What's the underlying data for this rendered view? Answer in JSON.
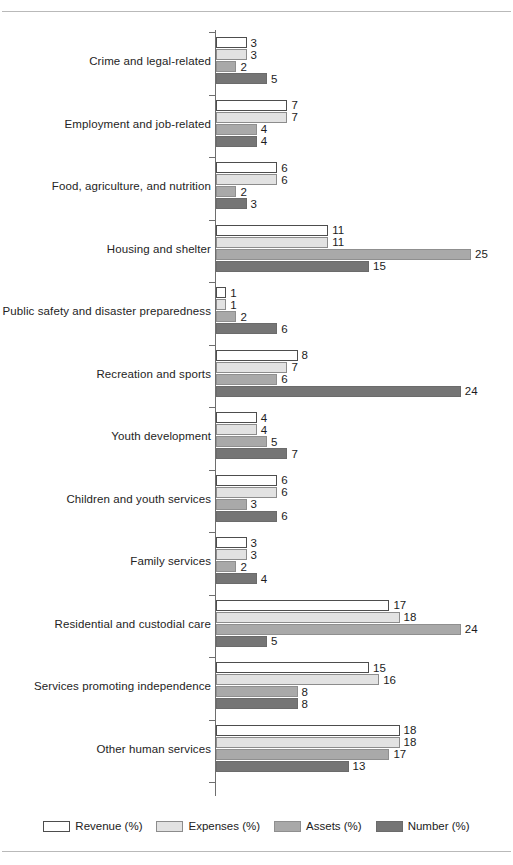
{
  "chart_data": {
    "type": "bar",
    "orientation": "horizontal",
    "title": "",
    "subtitle": "",
    "xlabel": "",
    "ylabel": "",
    "xlim": [
      0,
      25
    ],
    "grid": false,
    "legend_position": "bottom",
    "categories": [
      "Crime and legal-related",
      "Employment and job-related",
      "Food, agriculture, and nutrition",
      "Housing and shelter",
      "Public safety and disaster preparedness",
      "Recreation and sports",
      "Youth development",
      "Children and youth services",
      "Family services",
      "Residential and custodial care",
      "Services promoting independence",
      "Other human services"
    ],
    "series": [
      {
        "name": "Revenue (%)",
        "color": "#ffffff",
        "values": [
          3,
          7,
          6,
          11,
          1,
          8,
          4,
          6,
          3,
          17,
          15,
          18
        ]
      },
      {
        "name": "Expenses (%)",
        "color": "#e2e2e2",
        "values": [
          3,
          7,
          6,
          11,
          1,
          7,
          4,
          6,
          3,
          18,
          16,
          18
        ]
      },
      {
        "name": "Assets (%)",
        "color": "#a9a9a9",
        "values": [
          2,
          4,
          2,
          25,
          2,
          6,
          5,
          3,
          2,
          24,
          8,
          17
        ]
      },
      {
        "name": "Number (%)",
        "color": "#757575",
        "values": [
          5,
          4,
          3,
          15,
          6,
          24,
          7,
          6,
          4,
          5,
          8,
          13
        ]
      }
    ]
  },
  "legend": {
    "items": [
      {
        "label": "Revenue (%)"
      },
      {
        "label": "Expenses (%)"
      },
      {
        "label": "Assets (%)"
      },
      {
        "label": "Number (%)"
      }
    ]
  }
}
